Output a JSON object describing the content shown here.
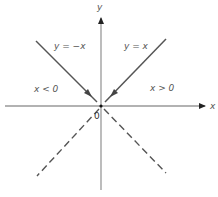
{
  "diagram": {
    "axes": {
      "x_label": "x",
      "y_label": "y",
      "origin_label": "0"
    },
    "lines": [
      {
        "label": "y = −x",
        "style": "solid",
        "region": "x < 0"
      },
      {
        "label": "y = x",
        "style": "solid",
        "region": "x > 0"
      },
      {
        "label": "",
        "style": "dashed",
        "region": "lower-left"
      },
      {
        "label": "",
        "style": "dashed",
        "region": "lower-right"
      }
    ],
    "regions": {
      "left": "x < 0",
      "right": "x > 0"
    },
    "colors": {
      "axis": "#888888",
      "line": "#444444"
    }
  }
}
